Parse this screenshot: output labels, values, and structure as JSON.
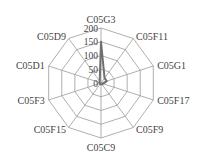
{
  "chart_data": {
    "type": "radar",
    "title": "",
    "categories": [
      "C05G3",
      "C05F11",
      "C05G1",
      "C05F17",
      "C05F9",
      "C05C9",
      "C05F15",
      "C05F3",
      "C05D1",
      "C05D9"
    ],
    "series": [
      {
        "name": "series-1",
        "values": [
          150,
          22,
          22,
          8,
          6,
          5,
          5,
          5,
          6,
          8
        ]
      }
    ],
    "radial_ticks": [
      0,
      50,
      100,
      150,
      200
    ],
    "rlim": [
      0,
      200
    ],
    "grid": true,
    "legend": null
  },
  "colors": {
    "grid": "#9a9a9a",
    "series": "#707070",
    "text": "#444444"
  }
}
